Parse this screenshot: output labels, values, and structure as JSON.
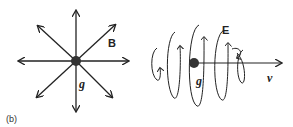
{
  "panel_label": "(b)",
  "left_diagram": {
    "field_label": "B",
    "charge_label": "g",
    "arrow_count": 8,
    "description": "Radial magnetic field lines emanating from a magnetic charge g"
  },
  "right_diagram": {
    "field_label": "E",
    "charge_label": "g",
    "velocity_label": "v",
    "description": "Moving magnetic charge g with velocity v, surrounded by circulating electric field loops E"
  },
  "colors": {
    "line": "#222222",
    "charge": "#333333"
  }
}
